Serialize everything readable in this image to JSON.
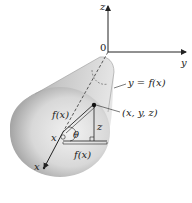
{
  "figure": {
    "labels": {
      "z_axis": "z",
      "y_axis": "y",
      "x_axis": "x",
      "origin": "0",
      "curve": "y = f(x)",
      "point": "(x, y, z)",
      "radius_slant": "f(x)",
      "radius_horizontal": "f(x)",
      "x_center": "x",
      "angle": "θ",
      "z_height": "z"
    },
    "colors": {
      "surface_light": "#e8e8e8",
      "surface_dark": "#8a8a8a",
      "axis": "#222222",
      "background": "#ffffff"
    }
  }
}
